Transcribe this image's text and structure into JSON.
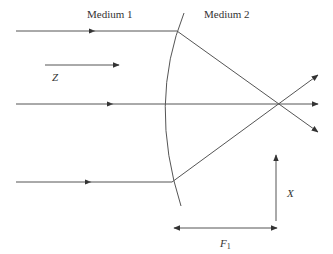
{
  "diagram": {
    "labels": {
      "medium1": "Medium 1",
      "medium2": "Medium 2",
      "z_axis": "Z",
      "x_axis": "X",
      "focal_length": "F",
      "focal_length_sub": "1"
    },
    "colors": {
      "line": "#555555",
      "text": "#333333",
      "background": "#ffffff"
    },
    "elements": {
      "interface": "curved refracting surface (convex toward medium 1)",
      "incident_rays": 3,
      "refracted_rays": 3,
      "focal_point": "rays converge at a single point on the axis"
    }
  }
}
